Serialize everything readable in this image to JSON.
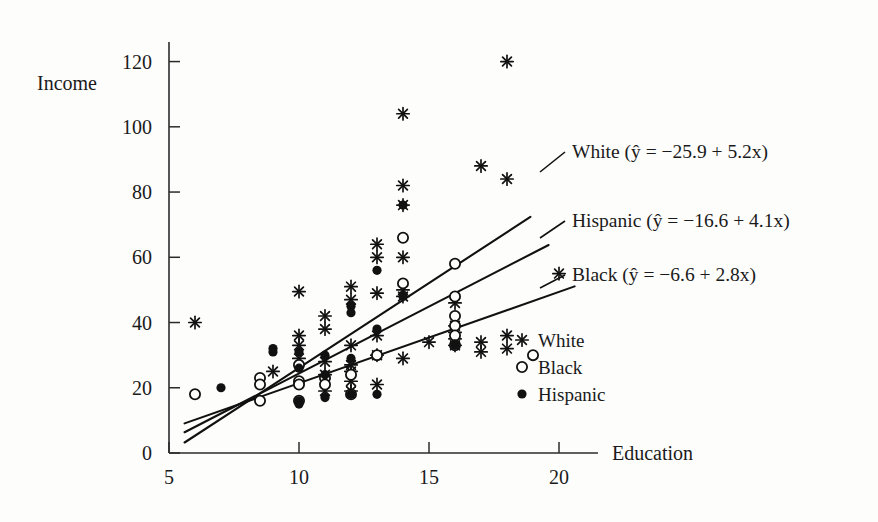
{
  "figure": {
    "background": "#fdfdfc",
    "ink": "#111111"
  },
  "axes": {
    "x_label": "Education",
    "y_label": "Income",
    "x_ticks": [
      5,
      10,
      15,
      20
    ],
    "y_ticks": [
      0,
      20,
      40,
      60,
      80,
      100,
      120
    ],
    "x_range": [
      5,
      21.5
    ],
    "y_range": [
      0,
      126
    ]
  },
  "annotations": [
    {
      "name": "white-line-label",
      "text": "White (ŷ = −25.9 + 5.2x)"
    },
    {
      "name": "hispanic-line-label",
      "text": "Hispanic (ŷ = −16.6 + 4.1x)"
    },
    {
      "name": "black-line-label",
      "text": "Black (ŷ = −6.6 + 2.8x)"
    }
  ],
  "legend": {
    "items": [
      {
        "label": "White",
        "marker": "asterisk"
      },
      {
        "label": "Black",
        "marker": "open-circle"
      },
      {
        "label": "Hispanic",
        "marker": "filled-circle"
      }
    ]
  },
  "chart_data": {
    "type": "scatter",
    "title": "",
    "xlabel": "Education",
    "ylabel": "Income",
    "xlim": [
      5,
      21.5
    ],
    "ylim": [
      0,
      126
    ],
    "grid": false,
    "legend_position": "inside-right",
    "series": [
      {
        "name": "White",
        "marker": "asterisk",
        "color": "#111111",
        "fit": {
          "intercept": -25.9,
          "slope": 5.2,
          "equation": "ŷ = −25.9 + 5.2x"
        },
        "points": [
          [
            6,
            40
          ],
          [
            9,
            25
          ],
          [
            10,
            49.5
          ],
          [
            10,
            36
          ],
          [
            10,
            33
          ],
          [
            10,
            29
          ],
          [
            11,
            42
          ],
          [
            11,
            38
          ],
          [
            11,
            28
          ],
          [
            11,
            24
          ],
          [
            11,
            19
          ],
          [
            12,
            51
          ],
          [
            12,
            47
          ],
          [
            12,
            33
          ],
          [
            12,
            27
          ],
          [
            12,
            25
          ],
          [
            12,
            22
          ],
          [
            12,
            19
          ],
          [
            13,
            64
          ],
          [
            13,
            60
          ],
          [
            13,
            49
          ],
          [
            13,
            36
          ],
          [
            13,
            30
          ],
          [
            13,
            21
          ],
          [
            14,
            104
          ],
          [
            14,
            82
          ],
          [
            14,
            76
          ],
          [
            14,
            60
          ],
          [
            14,
            50
          ],
          [
            14,
            48
          ],
          [
            14,
            29
          ],
          [
            15,
            34
          ],
          [
            16,
            46
          ],
          [
            16,
            39
          ],
          [
            16,
            37
          ],
          [
            16,
            35
          ],
          [
            16,
            33
          ],
          [
            17,
            88
          ],
          [
            17,
            34
          ],
          [
            17,
            31
          ],
          [
            18,
            120
          ],
          [
            18,
            84
          ],
          [
            18,
            36
          ],
          [
            18,
            32
          ],
          [
            20,
            55
          ]
        ]
      },
      {
        "name": "Black",
        "marker": "open-circle",
        "color": "#111111",
        "fit": {
          "intercept": -6.6,
          "slope": 2.8,
          "equation": "ŷ = −6.6 + 2.8x"
        },
        "points": [
          [
            6,
            18
          ],
          [
            8.5,
            23
          ],
          [
            8.5,
            21
          ],
          [
            8.5,
            16
          ],
          [
            10,
            27
          ],
          [
            10,
            22
          ],
          [
            10,
            21
          ],
          [
            10,
            16
          ],
          [
            11,
            23
          ],
          [
            11,
            21
          ],
          [
            12,
            24
          ],
          [
            12,
            18
          ],
          [
            13,
            30
          ],
          [
            14,
            66
          ],
          [
            14,
            52
          ],
          [
            16,
            58
          ],
          [
            16,
            48
          ],
          [
            16,
            42
          ],
          [
            16,
            39
          ],
          [
            16,
            36
          ],
          [
            16,
            33
          ],
          [
            19,
            30
          ]
        ]
      },
      {
        "name": "Hispanic",
        "marker": "filled-circle",
        "color": "#111111",
        "fit": {
          "intercept": -16.6,
          "slope": 4.1,
          "equation": "ŷ = −16.6 + 4.1x"
        },
        "points": [
          [
            7,
            20
          ],
          [
            9,
            32
          ],
          [
            9,
            31
          ],
          [
            10,
            31
          ],
          [
            10,
            26
          ],
          [
            10,
            16
          ],
          [
            10,
            15
          ],
          [
            11,
            30
          ],
          [
            11,
            24
          ],
          [
            11,
            17
          ],
          [
            12,
            45
          ],
          [
            12,
            43
          ],
          [
            12,
            29
          ],
          [
            12,
            18
          ],
          [
            13,
            56
          ],
          [
            13,
            38
          ],
          [
            13,
            18
          ],
          [
            14,
            76
          ],
          [
            14,
            48
          ],
          [
            16,
            33
          ]
        ]
      }
    ]
  }
}
